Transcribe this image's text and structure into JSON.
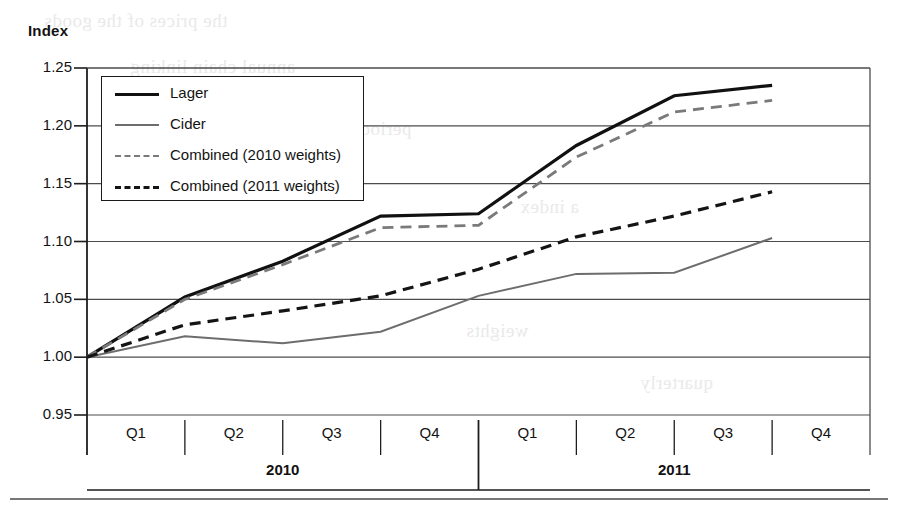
{
  "axis_title": "Index",
  "legend": {
    "entries": [
      {
        "label": "Lager",
        "style": "solid-thick-black",
        "color": "#111111"
      },
      {
        "label": "Cider",
        "style": "solid-thin-gray",
        "color": "#6d6d6d"
      },
      {
        "label": "Combined (2010 weights)",
        "style": "dashed-gray",
        "color": "#7a7a7a"
      },
      {
        "label": "Combined (2011 weights)",
        "style": "dashed-black",
        "color": "#141414"
      }
    ]
  },
  "bleed_text": {
    "b1": "the prices of the goods",
    "b2": "period",
    "b3": "a index",
    "b4": "weights",
    "b5": "quarterly",
    "b6": "annual chain linking"
  },
  "chart_data": {
    "type": "line",
    "title": "",
    "xlabel": "",
    "ylabel": "Index",
    "ylim": [
      0.95,
      1.25
    ],
    "yticks": [
      "0.95",
      "1.00",
      "1.05",
      "1.10",
      "1.15",
      "1.20",
      "1.25"
    ],
    "ytick_values": [
      0.95,
      1.0,
      1.05,
      1.1,
      1.15,
      1.2,
      1.25
    ],
    "grid": true,
    "legend_position": "upper-left-inside",
    "categories": [
      "Q1",
      "Q2",
      "Q3",
      "Q4",
      "Q1",
      "Q2",
      "Q3",
      "Q4"
    ],
    "groups": [
      {
        "label": "2010",
        "span": [
          0,
          3
        ]
      },
      {
        "label": "2011",
        "span": [
          4,
          7
        ]
      }
    ],
    "series": [
      {
        "name": "Lager",
        "color": "#111111",
        "dash": "none",
        "width": 3.2,
        "values": [
          1.0,
          1.052,
          1.083,
          1.122,
          1.124,
          1.183,
          1.226,
          1.235
        ]
      },
      {
        "name": "Cider",
        "color": "#6d6d6d",
        "dash": "none",
        "width": 2.0,
        "values": [
          1.0,
          1.018,
          1.012,
          1.022,
          1.053,
          1.072,
          1.073,
          1.103
        ]
      },
      {
        "name": "Combined (2010 weights)",
        "color": "#7a7a7a",
        "dash": "11,7",
        "width": 2.8,
        "values": [
          1.0,
          1.05,
          1.08,
          1.112,
          1.114,
          1.173,
          1.212,
          1.222
        ]
      },
      {
        "name": "Combined (2011 weights)",
        "color": "#141414",
        "dash": "11,7",
        "width": 3.2,
        "values": [
          1.0,
          1.028,
          1.04,
          1.053,
          1.076,
          1.104,
          1.122,
          1.143
        ]
      }
    ]
  }
}
